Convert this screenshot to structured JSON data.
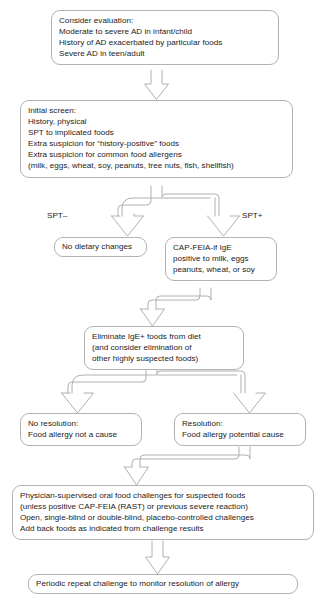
{
  "diagram": {
    "style": {
      "box_border_color": "#b3b3b3",
      "text_color": "#1b1b1b",
      "arrow_color": "#b0b0b0",
      "background": "#ffffff"
    },
    "nodes": [
      {
        "id": "consider",
        "text": "Consider evaluation:\nModerate to severe AD in infant/child\nHistory of AD exacerbated by particular foods\nSevere AD in teen/adult"
      },
      {
        "id": "initial",
        "text": "Initial screen:\nHistory, physical\nSPT to implicated foods\nExtra suspicion for “history-positive” foods\nExtra suspicion for common food allergens\n(milk, eggs, wheat, soy, peanuts, tree nuts, fish, shellfish)"
      },
      {
        "id": "no-dietary",
        "text": "No dietary changes"
      },
      {
        "id": "cap-feia",
        "text": "CAP-FEIA-if IgE\npositive to milk, eggs\npeanuts, wheat, or soy"
      },
      {
        "id": "eliminate",
        "text": "Eliminate IgE+ foods from diet\n(and consider elimination of\nother highly suspected foods)"
      },
      {
        "id": "no-resolution",
        "text": "No resolution:\nFood allergy not a cause"
      },
      {
        "id": "resolution",
        "text": "Resolution:\nFood allergy potential cause"
      },
      {
        "id": "challenges",
        "text": "Physician-supervised oral food challenges for suspected foods\n(unless positive CAP-FEIA (RAST) or previous severe reaction)\nOpen, single-blind or double-blind, placebo-controlled challenges\nAdd back foods as indicated from challenge results"
      },
      {
        "id": "periodic",
        "text": "Periodic repeat challenge to monitor resolution of allergy"
      }
    ],
    "branch_labels": {
      "spt_negative": "SPT–",
      "spt_positive": "SPT+"
    }
  }
}
